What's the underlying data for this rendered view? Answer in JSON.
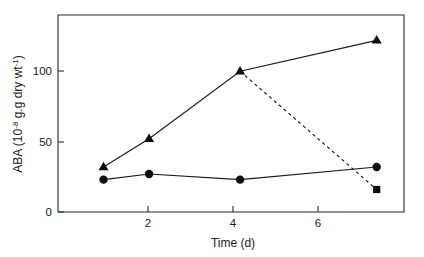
{
  "chart_data": {
    "type": "line",
    "title": "",
    "subtitle": "",
    "xlabel": "Time (d)",
    "ylabel": "ABA (10",
    "ylabel_exponent": "-8",
    "ylabel_mid": " g.g dry wt",
    "ylabel_exponent2": "-1",
    "ylabel_close": ")",
    "ylabel_full": "ABA (10⁻⁸ g.g dry wt⁻¹)",
    "xlim": [
      0,
      7.6
    ],
    "ylim": [
      0,
      140
    ],
    "xticks": [
      2,
      4,
      6
    ],
    "xtick_labels": [
      "2",
      "4",
      "6"
    ],
    "yticks": [
      0,
      50,
      100
    ],
    "ytick_labels": [
      "0",
      "50",
      "100"
    ],
    "grid": false,
    "legend": "none",
    "series": [
      {
        "name": "triangle-series",
        "marker": "triangle",
        "linestyle": "solid",
        "color": "#0d0d0d",
        "x": [
          1,
          2,
          4,
          7
        ],
        "values": [
          32,
          52,
          100,
          122
        ]
      },
      {
        "name": "circle-series",
        "marker": "circle",
        "linestyle": "solid",
        "color": "#0d0d0d",
        "x": [
          1,
          2,
          4,
          7
        ],
        "values": [
          23,
          27,
          23,
          32
        ]
      },
      {
        "name": "square-dashed-branch",
        "marker": "square",
        "linestyle": "dashed",
        "color": "#0d0d0d",
        "x": [
          4,
          7
        ],
        "values": [
          100,
          16
        ]
      }
    ]
  },
  "axes": {
    "x_tick_2": "2",
    "x_tick_4": "4",
    "x_tick_6": "6",
    "y_tick_0": "0",
    "y_tick_50": "50",
    "y_tick_100": "100",
    "x_axis_title": "Time (d)",
    "y_axis_title_part1": "ABA (10",
    "y_axis_title_sup1": "-8",
    "y_axis_title_part2": " g.g dry wt",
    "y_axis_title_sup2": "-1",
    "y_axis_title_part3": ")"
  }
}
